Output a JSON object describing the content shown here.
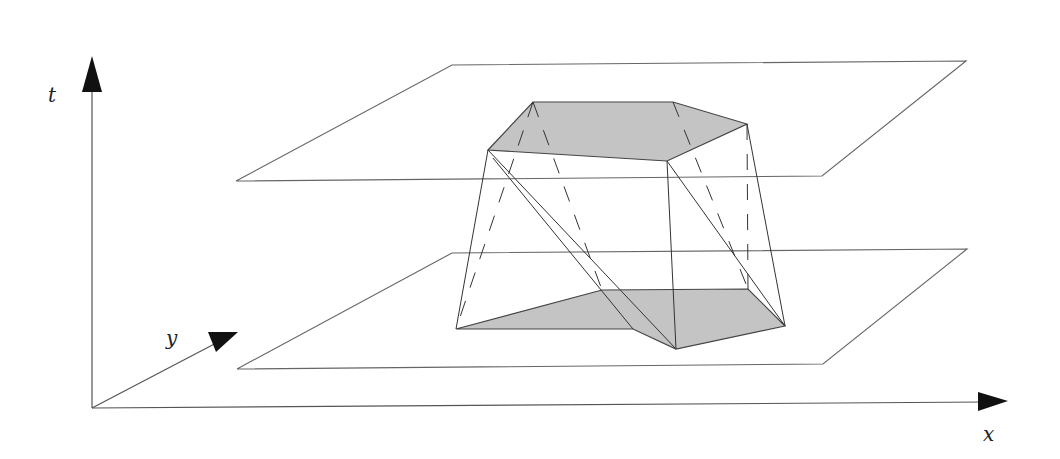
{
  "diagram": {
    "axes": {
      "t": {
        "label": "t",
        "origin": [
          92,
          408
        ],
        "end": [
          92,
          56
        ]
      },
      "x": {
        "label": "x",
        "origin": [
          92,
          408
        ],
        "end": [
          1008,
          402
        ]
      },
      "y": {
        "label": "y",
        "origin": [
          92,
          408
        ],
        "end": [
          238,
          332
        ]
      }
    },
    "planes": {
      "top": {
        "points": "236,181 452,65 966,61 822,176"
      },
      "bottom": {
        "points": "237,369 452,253 967,249 823,364"
      }
    },
    "top_face": {
      "points": "488,150 533,102 673,102 747,124 667,161"
    },
    "bottom_face": {
      "points": "456,329 602,290 748,289 785,326 676,349 633,329"
    },
    "solid_edges": [
      [
        488,
        150,
        456,
        329
      ],
      [
        488,
        150,
        676,
        349
      ],
      [
        493,
        158,
        633,
        329
      ],
      [
        667,
        161,
        676,
        349
      ],
      [
        667,
        161,
        785,
        326
      ],
      [
        747,
        124,
        785,
        326
      ]
    ],
    "hidden_edges": [
      [
        533,
        102,
        456,
        329
      ],
      [
        533,
        102,
        602,
        290
      ],
      [
        673,
        102,
        748,
        289
      ],
      [
        747,
        124,
        748,
        289
      ]
    ],
    "colors": {
      "face_fill": "#c4c4c4",
      "line": "#333333",
      "background": "#ffffff"
    }
  }
}
